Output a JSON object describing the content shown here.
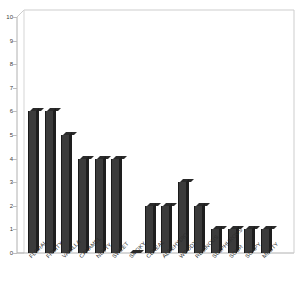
{
  "chart_data": {
    "type": "bar",
    "title": "",
    "subtitle": "",
    "xlabel": "",
    "ylabel": "",
    "ylim": [
      0,
      10
    ],
    "ytick_step": 1,
    "grid": false,
    "legend": "none",
    "orientation": "vertical",
    "style": "3d-bar",
    "bar_color": "#3b3b3b",
    "background_color": "#ffffff",
    "axis_color": "#b5b5b5",
    "categories": [
      "FLORAL",
      "FRUITY",
      "VANILLA",
      "CARAMEL",
      "NUTTY",
      "SWEET",
      "SMOKY",
      "CEREAL",
      "ALDEHYDIC",
      "WOODY",
      "RESINOUS",
      "SULPHUROUS",
      "SOUR",
      "SOAPY",
      "MUSTY"
    ],
    "values": [
      6,
      6,
      5,
      4,
      4,
      4,
      0,
      2,
      2,
      3,
      2,
      1,
      1,
      1,
      1
    ],
    "ytick_labels": [
      "0",
      "1",
      "2",
      "3",
      "4",
      "5",
      "6",
      "7",
      "8",
      "9",
      "10"
    ]
  }
}
